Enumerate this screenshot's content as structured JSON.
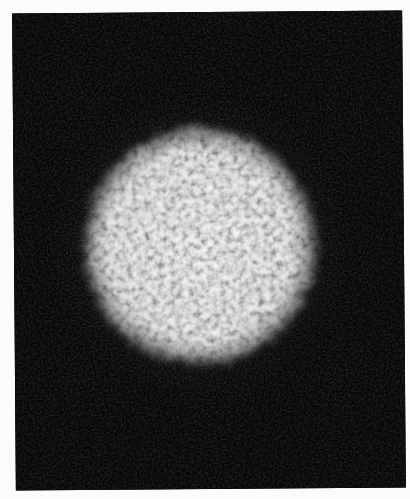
{
  "image": {
    "description": "Grayscale photograph of a circular speckle pattern (bright granular disc) on a black background",
    "background_color": "#070707",
    "page_color": "#fbfbfb",
    "speckle_colors": {
      "bright": "#e6e6e6",
      "dark": "#2a2a2a"
    }
  }
}
